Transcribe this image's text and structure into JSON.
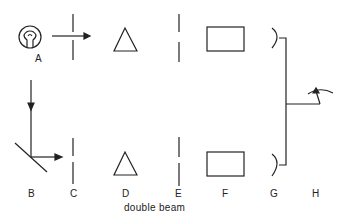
{
  "diagram": {
    "caption": "double beam",
    "labels": {
      "A": "A",
      "B": "B",
      "C": "C",
      "D": "D",
      "E": "E",
      "F": "F",
      "G": "G",
      "H": "H"
    },
    "components": [
      {
        "id": "A",
        "symbol": "light-source-bulb"
      },
      {
        "id": "B",
        "symbol": "mirror-beam-splitter"
      },
      {
        "id": "C",
        "symbol": "slit"
      },
      {
        "id": "D",
        "symbol": "prism-triangle"
      },
      {
        "id": "E",
        "symbol": "slit"
      },
      {
        "id": "F",
        "symbol": "sample-cell-rectangle"
      },
      {
        "id": "G",
        "symbol": "detector"
      },
      {
        "id": "H",
        "symbol": "meter-readout"
      }
    ],
    "colors": {
      "stroke": "#222222",
      "background": "#ffffff"
    }
  }
}
